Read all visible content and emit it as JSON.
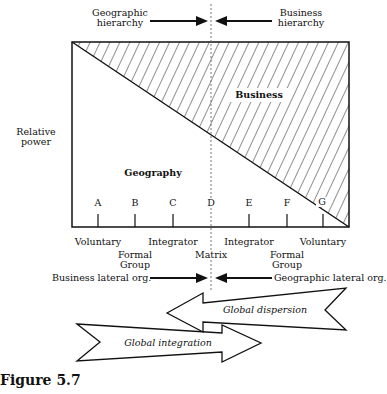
{
  "top": {
    "left_label": "Geographic\nhierarchy",
    "right_label": "Business\nhierarchy"
  },
  "chart": {
    "y_axis_label": "Relative\npower",
    "region_upper": "Business",
    "region_lower": "Geography",
    "points": [
      {
        "letter": "A",
        "x": 98
      },
      {
        "letter": "B",
        "x": 135
      },
      {
        "letter": "C",
        "x": 173
      },
      {
        "letter": "D",
        "x": 211
      },
      {
        "letter": "E",
        "x": 249
      },
      {
        "letter": "F",
        "x": 287
      },
      {
        "letter": "G",
        "x": 323
      }
    ],
    "structures": [
      {
        "label": "Voluntary",
        "x": 98,
        "row": 0
      },
      {
        "label": "Formal\nGroup",
        "x": 135,
        "row": 1
      },
      {
        "label": "Integrator",
        "x": 173,
        "row": 0
      },
      {
        "label": "Matrix",
        "x": 211,
        "row": 1
      },
      {
        "label": "Integrator",
        "x": 249,
        "row": 0
      },
      {
        "label": "Formal\nGroup",
        "x": 287,
        "row": 1
      },
      {
        "label": "Voluntary",
        "x": 323,
        "row": 0
      }
    ]
  },
  "lateral": {
    "left_label": "Business lateral org.",
    "right_label": "Geographic lateral org."
  },
  "arrows": {
    "dispersion": "Global dispersion",
    "integration": "Global integration"
  },
  "caption": {
    "title": "Figure 5.7"
  }
}
